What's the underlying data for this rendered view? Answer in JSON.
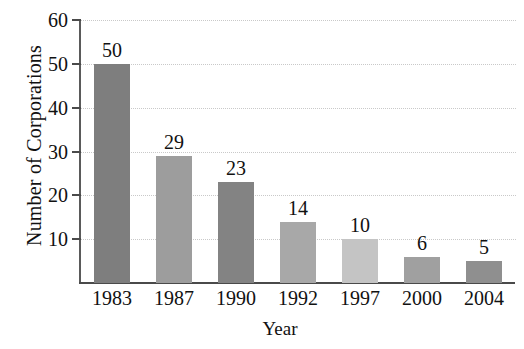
{
  "chart_data": {
    "type": "bar",
    "title": "",
    "xlabel": "Year",
    "ylabel": "Number of Corporations",
    "categories": [
      "1983",
      "1987",
      "1990",
      "1992",
      "1997",
      "2000",
      "2004"
    ],
    "values": [
      50,
      29,
      23,
      14,
      10,
      6,
      5
    ],
    "value_labels": [
      "50",
      "29",
      "23",
      "14",
      "10",
      "6",
      "5"
    ],
    "bar_colors": [
      "#7e7e7e",
      "#9d9d9d",
      "#838383",
      "#a8a8a8",
      "#c4c4c4",
      "#a0a0a0",
      "#8f8f8f"
    ],
    "ylim": [
      0,
      60
    ],
    "yticks": [
      10,
      20,
      30,
      40,
      50,
      60
    ],
    "ytick_labels": [
      "10",
      "20",
      "30",
      "40",
      "50",
      "60"
    ],
    "grid": true,
    "grid_style": "dotted",
    "grid_color": "#c9c9c9",
    "legend": "none",
    "axis_color": "#4a4a4a",
    "text_color": "#111111",
    "background": "#ffffff"
  }
}
